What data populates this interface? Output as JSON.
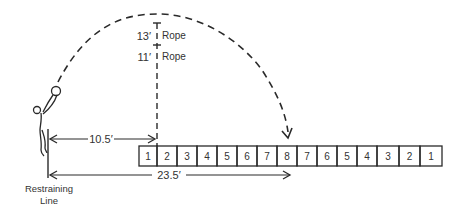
{
  "diagram": {
    "type": "throw-distance-target",
    "labels": {
      "rope_high": "13′",
      "rope_high_text": "Rope",
      "rope_low": "11′",
      "rope_low_text": "Rope",
      "distance_short": "10.5′",
      "distance_long": "23.5′",
      "restraining_line_1": "Restraining",
      "restraining_line_2": "Line"
    },
    "target_boxes": [
      "1",
      "2",
      "3",
      "4",
      "5",
      "6",
      "7",
      "8",
      "7",
      "6",
      "5",
      "4",
      "3",
      "2",
      "1"
    ],
    "colors": {
      "ink": "#2a2a2a",
      "background": "#ffffff"
    }
  }
}
